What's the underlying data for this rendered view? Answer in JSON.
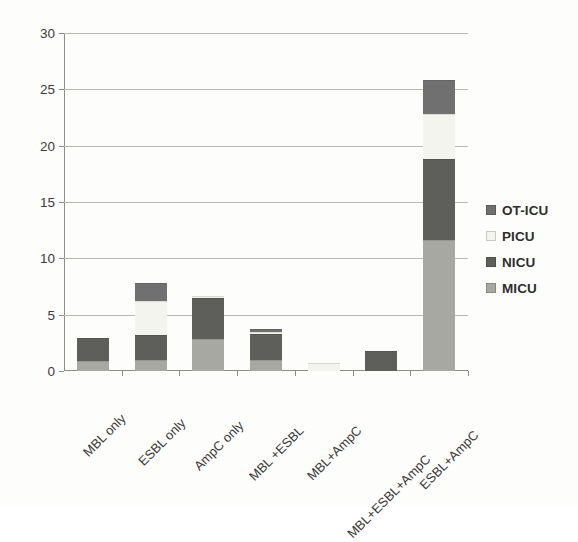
{
  "chart_data": {
    "type": "bar",
    "subtype": "stacked-vertical",
    "title": "",
    "subtitle": "",
    "xlabel": "",
    "ylabel": "",
    "ylim": [
      0,
      30
    ],
    "yticks": [
      0,
      5,
      10,
      15,
      20,
      25,
      30
    ],
    "ytick_labels": [
      "0",
      "5",
      "10",
      "15",
      "20",
      "25",
      "30"
    ],
    "grid": true,
    "grid_axis": "y",
    "legend_position": "right",
    "categories": [
      "MBL only",
      "ESBL only",
      "AmpC only",
      "MBL +ESBL",
      "MBL+AmpC",
      "MBL+ESBL+AmpC",
      "ESBL+AmpC"
    ],
    "series": [
      {
        "name": "MICU",
        "color": "#a8a8a2",
        "values": [
          0.9,
          1.0,
          2.8,
          1.0,
          0.0,
          0.0,
          11.6
        ]
      },
      {
        "name": "NICU",
        "color": "#5e5e5a",
        "values": [
          2.0,
          2.2,
          3.7,
          2.3,
          0.0,
          1.8,
          7.2
        ]
      },
      {
        "name": "PICU",
        "color": "#f4f4ef",
        "values": [
          0.0,
          3.0,
          0.2,
          0.2,
          0.75,
          0.0,
          4.0
        ]
      },
      {
        "name": "OT-ICU",
        "color": "#707070",
        "values": [
          0.0,
          1.6,
          0.0,
          0.2,
          0.0,
          0.0,
          3.0
        ]
      }
    ],
    "totals": [
      2.9,
      7.8,
      6.7,
      3.7,
      0.75,
      1.8,
      25.8
    ],
    "legend_entries": [
      "OT-ICU",
      "PICU",
      "NICU",
      "MICU"
    ]
  }
}
